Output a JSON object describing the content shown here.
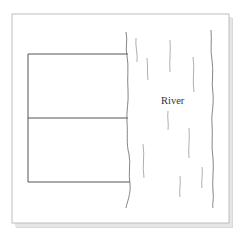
{
  "diagram": {
    "labels": {
      "river": "River"
    },
    "colors": {
      "frame_border": "#b8b8b8",
      "shadow": "#d6d6d6",
      "field_lines": "#555555",
      "bank_lines": "#777777",
      "current_lines": "#9a9a9a",
      "label_text": "#333333"
    },
    "frame": {
      "x": 12,
      "y": 14,
      "width": 217,
      "height": 209
    },
    "fields": [
      {
        "name": "upper-field",
        "x": 28,
        "y": 54,
        "width": 100,
        "height": 64
      },
      {
        "name": "lower-field",
        "x": 28,
        "y": 118,
        "width": 100,
        "height": 64
      }
    ],
    "river": {
      "label_position": {
        "x": 161,
        "y": 104
      }
    }
  }
}
